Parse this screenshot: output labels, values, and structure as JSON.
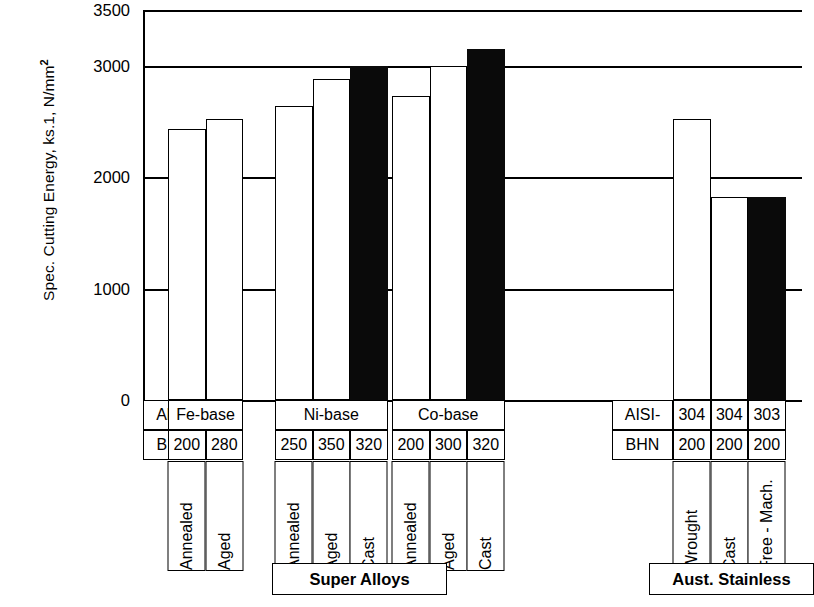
{
  "chart_data": {
    "type": "bar",
    "title": "",
    "ylabel": "Spec. Cutting Energy, ks.1, N/mm",
    "ylabel_sup": "2",
    "xlabel": "",
    "ylim": [
      0,
      3500
    ],
    "yticks": [
      0,
      1000,
      2000,
      3000,
      3500
    ],
    "ytick_labels": [
      "0",
      "1000",
      "2000",
      "3000",
      "3500"
    ],
    "grid": true,
    "legend": "none",
    "categories": [
      "Fe-base Annealed 200 BHN",
      "Fe-base Aged 280 BHN",
      "Ni-base Annealed 250 BHN",
      "Ni-base Aged 350 BHN",
      "Ni-base Cast 320 BHN",
      "Co-base Annealed 200 BHN",
      "Co-base Aged 300 BHN",
      "Co-base Cast 320 BHN",
      "AISI-304 Wrought 200 BHN",
      "AISI-304 Cast 200 BHN",
      "AISI-303 Free-Mach. 200 BHN"
    ],
    "values": [
      2430,
      2520,
      2640,
      2880,
      3000,
      2730,
      3000,
      3150,
      2520,
      1820,
      1820
    ],
    "bar_fill": [
      "open",
      "open",
      "open",
      "open",
      "solid",
      "open",
      "open",
      "solid",
      "open",
      "open",
      "solid"
    ]
  },
  "axis": {
    "y_title_main": "Spec. Cutting Energy, ks.1, N/mm",
    "y_title_sup": "2",
    "ticks": [
      {
        "label": "3500",
        "value": 3500
      },
      {
        "label": "3000",
        "value": 3000
      },
      {
        "label": "2000",
        "value": 2000
      },
      {
        "label": "1000",
        "value": 1000
      },
      {
        "label": "0",
        "value": 0
      }
    ]
  },
  "table": {
    "row_headers": {
      "alloy": "Alloy",
      "bhn": "BHN",
      "aisi": "AISI-"
    },
    "groups": [
      {
        "name": "Fe-base",
        "bhn": [
          "200",
          "280"
        ],
        "conditions": [
          "Annealed",
          "Aged"
        ]
      },
      {
        "name": "Ni-base",
        "bhn": [
          "250",
          "350",
          "320"
        ],
        "conditions": [
          "Annealed",
          "Aged",
          "Cast"
        ]
      },
      {
        "name": "Co-base",
        "bhn": [
          "200",
          "300",
          "320"
        ],
        "conditions": [
          "Annealed",
          "Aged",
          "Cast"
        ]
      },
      {
        "name": "AISI-",
        "grades": [
          "304",
          "304",
          "303"
        ],
        "bhn": [
          "200",
          "200",
          "200"
        ],
        "conditions": [
          "Wrought",
          "Cast",
          "Free - Mach."
        ]
      }
    ],
    "group_labels": [
      {
        "text": "Super Alloys"
      },
      {
        "text": "Aust. Stainless"
      }
    ]
  },
  "colors": {
    "line": "#000000",
    "bar_open": "#ffffff",
    "bar_solid": "#0a0a0a",
    "background": "#ffffff"
  }
}
